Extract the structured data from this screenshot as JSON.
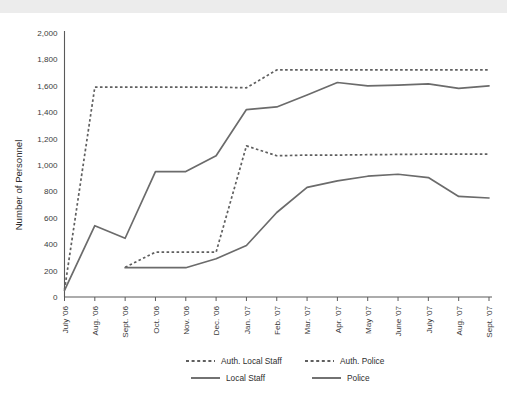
{
  "chart_data": {
    "type": "line",
    "title": "",
    "xlabel": "",
    "ylabel": "Number of Personnel",
    "ylim": [
      0,
      2000
    ],
    "ytick_values": [
      0,
      200,
      400,
      600,
      800,
      1000,
      1200,
      1400,
      1600,
      1800,
      2000
    ],
    "ytick_labels": [
      "0",
      "200",
      "400",
      "600",
      "800",
      "1,000",
      "1,200",
      "1,400",
      "1,600",
      "1,800",
      "2,000"
    ],
    "grid": false,
    "legend_position": "bottom",
    "categories": [
      "July '06",
      "Aug. '06",
      "Sept. '06",
      "Oct. '06",
      "Nov. '06",
      "Dec. '06",
      "Jan. '07",
      "Feb. '07",
      "Mar. '07",
      "Apr. '07",
      "May '07",
      "June '07",
      "July '07",
      "Aug. '07",
      "Sept. '07"
    ],
    "series": [
      {
        "name": "Auth. Local Staff",
        "style": "dashed",
        "color": "#5f5f5f",
        "values": [
          55,
          1590,
          1590,
          1590,
          1590,
          1590,
          1585,
          1720,
          1720,
          1720,
          1720,
          1720,
          1720,
          1720,
          1720
        ]
      },
      {
        "name": "Auth. Police",
        "style": "dashed",
        "color": "#5f5f5f",
        "values": [
          null,
          null,
          225,
          340,
          340,
          340,
          1145,
          1070,
          1075,
          1075,
          1078,
          1080,
          1082,
          1082,
          1082
        ]
      },
      {
        "name": "Local Staff",
        "style": "solid",
        "color": "#6b6b6b",
        "values": [
          50,
          540,
          445,
          950,
          950,
          1070,
          1420,
          1440,
          1530,
          1625,
          1600,
          1605,
          1615,
          1580,
          1600
        ]
      },
      {
        "name": "Police",
        "style": "solid",
        "color": "#6b6b6b",
        "values": [
          null,
          null,
          222,
          222,
          222,
          290,
          390,
          640,
          830,
          880,
          915,
          930,
          905,
          762,
          750
        ]
      }
    ],
    "legend": [
      {
        "label": "Auth. Local Staff",
        "style": "dashed"
      },
      {
        "label": "Auth. Police",
        "style": "dashed"
      },
      {
        "label": "Local Staff",
        "style": "solid"
      },
      {
        "label": "Police",
        "style": "solid"
      }
    ]
  }
}
